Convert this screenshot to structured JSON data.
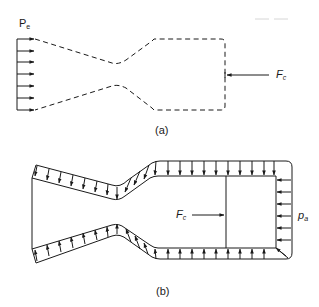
{
  "figure_a": {
    "caption": "(a)",
    "exit_pressure_label": {
      "main": "P",
      "sub": "e"
    },
    "chamber_force_label": {
      "main": "F",
      "sub": "c"
    },
    "arrow_count_exit": 7
  },
  "figure_b": {
    "caption": "(b)",
    "chamber_force_label": {
      "main": "F",
      "sub": "c"
    },
    "ambient_pressure_label": {
      "main": "p",
      "sub": "a"
    }
  },
  "colors": {
    "line": "#1a1a1a",
    "background": "#ffffff"
  }
}
